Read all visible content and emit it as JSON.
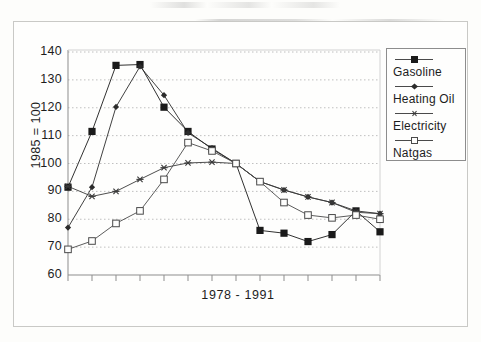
{
  "chart_data": {
    "type": "line",
    "title": "",
    "xlabel": "1978 - 1991",
    "ylabel": "1985 = 100",
    "ylim": [
      60,
      140
    ],
    "yticks": [
      60,
      70,
      80,
      90,
      100,
      110,
      120,
      130,
      140
    ],
    "grid": "horizontal-dotted",
    "legend_position": "right",
    "x": [
      1978,
      1979,
      1980,
      1981,
      1982,
      1983,
      1984,
      1985,
      1986,
      1987,
      1988,
      1989,
      1990,
      1991
    ],
    "categories": [
      "1978",
      "1979",
      "1980",
      "1981",
      "1982",
      "1983",
      "1984",
      "1985",
      "1986",
      "1987",
      "1988",
      "1989",
      "1990",
      "1991"
    ],
    "xtick_labels_visible": false,
    "series": [
      {
        "name": "Gasoline",
        "marker": "filled-square",
        "color": "#1a1a1a",
        "values": [
          91.5,
          111.5,
          135.2,
          135.5,
          120.2,
          111.5,
          105.2,
          100.0,
          76.0,
          75.0,
          72.0,
          74.5,
          83.0,
          75.5
        ]
      },
      {
        "name": "Heating Oil",
        "marker": "small-diamond",
        "color": "#2b2b2b",
        "values": [
          77.0,
          91.5,
          120.3,
          134.8,
          124.5,
          111.0,
          105.5,
          100.0,
          93.5,
          90.5,
          88.0,
          86.0,
          83.0,
          82.0
        ]
      },
      {
        "name": "Electricity",
        "marker": "asterisk",
        "color": "#3a3a3a",
        "values": [
          91.8,
          88.2,
          90.0,
          94.3,
          98.5,
          100.2,
          100.5,
          100.0,
          93.5,
          90.5,
          88.0,
          86.0,
          82.5,
          82.0
        ]
      },
      {
        "name": "Natgas",
        "marker": "open-square",
        "color": "#4a4a4a",
        "values": [
          69.2,
          72.2,
          78.5,
          83.0,
          94.3,
          107.5,
          104.5,
          100.0,
          93.5,
          86.0,
          81.5,
          80.5,
          81.5,
          80.0
        ]
      }
    ]
  },
  "axis": {
    "y_title": "1985 = 100",
    "x_title": "1978 - 1991"
  },
  "legend": {
    "items": [
      {
        "label": "Gasoline",
        "marker": "filled-square"
      },
      {
        "label": "Heating Oil",
        "marker": "small-diamond"
      },
      {
        "label": "Electricity",
        "marker": "asterisk"
      },
      {
        "label": "Natgas",
        "marker": "open-square"
      }
    ]
  }
}
